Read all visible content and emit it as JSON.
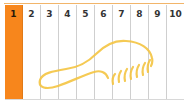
{
  "grid": {
    "columns": [
      {
        "label": "1",
        "filled": true
      },
      {
        "label": "2",
        "filled": false
      },
      {
        "label": "3",
        "filled": false
      },
      {
        "label": "4",
        "filled": false
      },
      {
        "label": "5",
        "filled": false
      },
      {
        "label": "6",
        "filled": false
      },
      {
        "label": "7",
        "filled": false
      },
      {
        "label": "8",
        "filled": false
      },
      {
        "label": "9",
        "filled": false
      },
      {
        "label": "10",
        "filled": false
      }
    ]
  },
  "colors": {
    "fill": "#f7861c",
    "shape_stroke": "#f5c542",
    "grid_line": "#cfcfcf",
    "top_rule": "#f2b56a"
  },
  "shape": {
    "icon": "brush-outline-icon"
  }
}
